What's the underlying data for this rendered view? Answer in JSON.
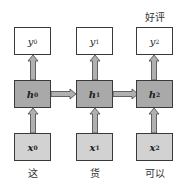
{
  "diagram": {
    "type": "rnn-unrolled",
    "output_label": "好评",
    "columns": [
      {
        "output": {
          "sym": "y",
          "sub": "0"
        },
        "hidden": {
          "sym": "h",
          "sub": "0"
        },
        "input": {
          "sym": "x",
          "sub": "0"
        },
        "word": "这"
      },
      {
        "output": {
          "sym": "y",
          "sub": "1"
        },
        "hidden": {
          "sym": "h",
          "sub": "1"
        },
        "input": {
          "sym": "x",
          "sub": "1"
        },
        "word": "货"
      },
      {
        "output": {
          "sym": "y",
          "sub": "2"
        },
        "hidden": {
          "sym": "h",
          "sub": "2"
        },
        "input": {
          "sym": "x",
          "sub": "2"
        },
        "word": "可以"
      }
    ],
    "colors": {
      "output_fill": "#ffffff",
      "hidden_fill": "#a9a9a9",
      "input_fill": "#d2d2d2",
      "border": "#3a3a3a",
      "arrow_fill": "#b0b0b0"
    }
  }
}
